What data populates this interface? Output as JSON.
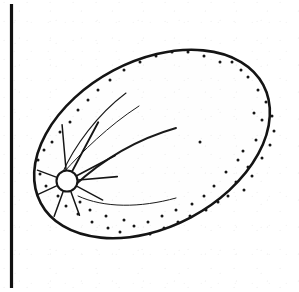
{
  "figure": {
    "style": "ink line drawing with stipple shading",
    "caption": "",
    "background_color": "#ffffff",
    "ink_color": "#1a1a1a",
    "body_fill_color": "#fefefe"
  },
  "canvas": {
    "width": 299,
    "height": 292
  },
  "margin_rule": {
    "name": "left page margin rule",
    "x": 11.5,
    "y_start": 4,
    "y_end": 288,
    "stroke_width": 3.2,
    "color": "#111111"
  },
  "seed_body": {
    "name": "seed outline",
    "shape": "ellipse rotated",
    "center_x": 152,
    "center_y": 144,
    "radius_x": 126,
    "radius_y": 83,
    "rotation_deg": -28,
    "stroke_width": 2.6,
    "color": "#141414"
  },
  "hilum": {
    "name": "hilum",
    "center_x": 67,
    "center_y": 181,
    "radius": 10.5,
    "stroke_width": 2.1,
    "color": "#151515",
    "ray_count": 9,
    "ray_label": "radiating micropyle lines"
  },
  "hilum_rays": [
    {
      "angle_deg": 95,
      "length": 46,
      "width": 1.5
    },
    {
      "angle_deg": 62,
      "length": 56,
      "width": 1.9
    },
    {
      "angle_deg": 28,
      "length": 44,
      "width": 1.7
    },
    {
      "angle_deg": 5,
      "length": 40,
      "width": 1.6
    },
    {
      "angle_deg": 332,
      "length": 30,
      "width": 1.4
    },
    {
      "angle_deg": 290,
      "length": 26,
      "width": 1.5
    },
    {
      "angle_deg": 250,
      "length": 27,
      "width": 1.5
    },
    {
      "angle_deg": 205,
      "length": 22,
      "width": 1.4
    },
    {
      "angle_deg": 160,
      "length": 21,
      "width": 1.3
    }
  ],
  "contour_lines": [
    {
      "name": "upper raphe contour",
      "path": "M 62 174 C 74 146 98 114 126 93",
      "width": 1.1
    },
    {
      "name": "inner raphe contour",
      "path": "M 64 172 C 82 152 108 126 139 106",
      "width": 1.0
    },
    {
      "name": "cotyledon ridge",
      "path": "M 74 186 C 100 162 134 140 176 128",
      "width": 1.9
    },
    {
      "name": "lower cotyledon edge",
      "path": "M 78 196 C 104 208 140 208 176 198",
      "width": 1.0
    }
  ],
  "stipple": {
    "name": "surface stipple texture",
    "dot_radius": 1.5,
    "color": "#161616",
    "count": 62,
    "points": [
      [
        248,
        77
      ],
      [
        258,
        90
      ],
      [
        266,
        102
      ],
      [
        241,
        70
      ],
      [
        232,
        62
      ],
      [
        272,
        116
      ],
      [
        274,
        131
      ],
      [
        262,
        120
      ],
      [
        254,
        113
      ],
      [
        270,
        145
      ],
      [
        256,
        140
      ],
      [
        243,
        151
      ],
      [
        262,
        158
      ],
      [
        248,
        167
      ],
      [
        238,
        160
      ],
      [
        252,
        176
      ],
      [
        236,
        182
      ],
      [
        226,
        172
      ],
      [
        244,
        190
      ],
      [
        228,
        196
      ],
      [
        214,
        186
      ],
      [
        218,
        202
      ],
      [
        204,
        196
      ],
      [
        206,
        210
      ],
      [
        192,
        204
      ],
      [
        190,
        216
      ],
      [
        176,
        210
      ],
      [
        178,
        222
      ],
      [
        162,
        216
      ],
      [
        164,
        228
      ],
      [
        148,
        222
      ],
      [
        150,
        234
      ],
      [
        134,
        226
      ],
      [
        120,
        232
      ],
      [
        124,
        220
      ],
      [
        108,
        228
      ],
      [
        106,
        216
      ],
      [
        92,
        222
      ],
      [
        90,
        210
      ],
      [
        78,
        214
      ],
      [
        80,
        202
      ],
      [
        66,
        206
      ],
      [
        58,
        196
      ],
      [
        46,
        186
      ],
      [
        40,
        174
      ],
      [
        38,
        160
      ],
      [
        44,
        150
      ],
      [
        52,
        142
      ],
      [
        60,
        132
      ],
      [
        70,
        122
      ],
      [
        78,
        110
      ],
      [
        88,
        100
      ],
      [
        98,
        90
      ],
      [
        110,
        80
      ],
      [
        124,
        70
      ],
      [
        140,
        62
      ],
      [
        156,
        56
      ],
      [
        172,
        52
      ],
      [
        188,
        52
      ],
      [
        204,
        56
      ],
      [
        220,
        62
      ],
      [
        200,
        142
      ]
    ]
  },
  "labels": {
    "figure_label": "",
    "scale_bar": ""
  }
}
